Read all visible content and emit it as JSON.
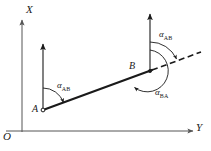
{
  "figure": {
    "axes": {
      "x_label": "X",
      "y_label": "Y",
      "origin_label": "O"
    },
    "points": [
      {
        "id": "A",
        "label": "A"
      },
      {
        "id": "B",
        "label": "B"
      }
    ],
    "angles": [
      {
        "id": "alpha-ab-at-a",
        "symbol": "α",
        "subscript": "AB"
      },
      {
        "id": "alpha-ab-at-b",
        "symbol": "α",
        "subscript": "AB"
      },
      {
        "id": "alpha-ba-at-b",
        "symbol": "α",
        "subscript": "BA"
      }
    ],
    "colors": {
      "stroke": "#1a1a1a",
      "axis": "#555555",
      "background": "#ffffff"
    }
  }
}
